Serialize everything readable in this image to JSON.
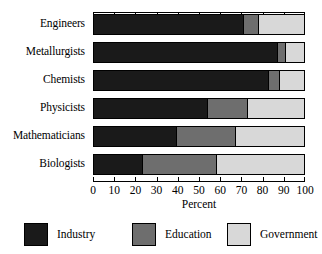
{
  "chart_data": {
    "type": "bar",
    "orientation": "horizontal",
    "stacked": true,
    "stack_mode": "percent",
    "title": "",
    "xlabel": "Percent",
    "ylabel": "",
    "xlim": [
      0,
      100
    ],
    "xticks": [
      0,
      10,
      20,
      30,
      40,
      50,
      60,
      70,
      80,
      90,
      100
    ],
    "xticklabels": [
      "0",
      "10",
      "20",
      "30",
      "40",
      "50",
      "60",
      "70",
      "80",
      "90",
      "100"
    ],
    "grid": false,
    "legend_position": "bottom",
    "categories": [
      "Engineers",
      "Metallurgists",
      "Chemists",
      "Physicists",
      "Mathematicians",
      "Biologists"
    ],
    "series": [
      {
        "name": "Industry",
        "color": "#1a1a1a",
        "values": [
          71,
          87,
          83,
          54,
          39,
          23
        ]
      },
      {
        "name": "Education",
        "color": "#6e6e6e",
        "values": [
          7,
          4,
          5,
          19,
          28,
          35
        ]
      },
      {
        "name": "Government",
        "color": "#d8d8d8",
        "values": [
          22,
          9,
          12,
          27,
          33,
          42
        ]
      }
    ]
  },
  "axis": {
    "x_title": "Percent",
    "tick_labels": [
      "0",
      "10",
      "20",
      "30",
      "40",
      "50",
      "60",
      "70",
      "80",
      "90",
      "100"
    ]
  },
  "categories": {
    "0": "Engineers",
    "1": "Metallurgists",
    "2": "Chemists",
    "3": "Physicists",
    "4": "Mathematicians",
    "5": "Biologists"
  },
  "legend": {
    "items": [
      {
        "label": "Industry",
        "color": "#1a1a1a"
      },
      {
        "label": "Education",
        "color": "#6e6e6e"
      },
      {
        "label": "Government",
        "color": "#d8d8d8"
      }
    ]
  }
}
